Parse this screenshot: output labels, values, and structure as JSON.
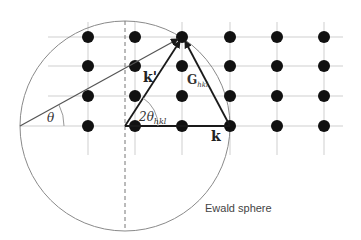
{
  "diagram": {
    "labels": {
      "theta": "θ",
      "two_theta_prefix": "2θ",
      "two_theta_sub": "hkl",
      "k_prime": "k'",
      "k": "k",
      "G": "G",
      "G_sub": "hkl",
      "sphere": "Ewald sphere"
    },
    "lattice": {
      "columns_x": [
        88,
        135,
        182,
        230,
        277,
        324
      ],
      "rows_y": [
        37,
        66,
        96,
        126
      ]
    },
    "sphere": {
      "cx": 125,
      "cy": 126,
      "r": 105
    },
    "colors": {
      "dot": "#111111",
      "grid": "#c8c8c8",
      "circle": "#8a8a8a",
      "arrow": "#1a1a1a",
      "text": "#333333"
    }
  }
}
